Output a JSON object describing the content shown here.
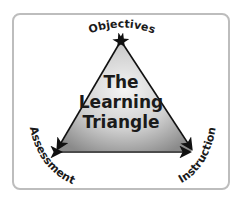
{
  "diagram": {
    "center_title_lines": [
      "The",
      "Learning",
      "Triangle"
    ],
    "vertices": {
      "top": "Objectives",
      "bottom_left": "Assessment",
      "bottom_right": "Instruction"
    },
    "colors": {
      "frame_border": "#bdbdbd",
      "triangle_fill_light": "#f2f2f2",
      "triangle_fill_dark": "#8c8c8c",
      "arrow": "#111111",
      "text": "#1a1a1a"
    }
  }
}
